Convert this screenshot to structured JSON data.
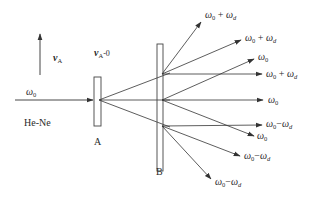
{
  "diagram": {
    "colors": {
      "line": "#333333",
      "plate_fill": "#ffffff",
      "text": "#2a2a2a"
    },
    "source": {
      "label": "He-Ne",
      "beam_label_base": "ω",
      "beam_label_sub": "0"
    },
    "velocity": {
      "label_base": "v",
      "label_sub": "A"
    },
    "velocity_zero": {
      "label_base": "v",
      "label_sub": "A",
      "label_suffix": "-0"
    },
    "plate_a": {
      "label": "A"
    },
    "plate_b": {
      "label": "B"
    },
    "output_beams": [
      {
        "group": "upper",
        "base": "ω",
        "sub": "0",
        "op": " + ",
        "base2": "ω",
        "sub2": "d",
        "text": "ω0 + ωd"
      },
      {
        "group": "upper",
        "base": "ω",
        "sub": "0",
        "op": " + ",
        "base2": "ω",
        "sub2": "d",
        "text": "ω0 + ωd"
      },
      {
        "group": "upper",
        "base": "ω",
        "sub": "0",
        "op": " + ",
        "base2": "ω",
        "sub2": "d",
        "text": "ω0 + ωd"
      },
      {
        "group": "middle",
        "base": "ω",
        "sub": "0",
        "text": "ω0"
      },
      {
        "group": "middle",
        "base": "ω",
        "sub": "0",
        "text": "ω0"
      },
      {
        "group": "middle",
        "base": "ω",
        "sub": "0",
        "text": "ω0"
      },
      {
        "group": "lower",
        "base": "ω",
        "sub": "0",
        "op": "−",
        "base2": "ω",
        "sub2": "d",
        "text": "ω0−ωd"
      },
      {
        "group": "lower",
        "base": "ω",
        "sub": "0",
        "op": "−",
        "base2": "ω",
        "sub2": "d",
        "text": "ω0−ωd"
      },
      {
        "group": "lower",
        "base": "ω",
        "sub": "0",
        "op": "−",
        "base2": "ω",
        "sub2": "d",
        "text": "ω0−ωd"
      }
    ]
  }
}
